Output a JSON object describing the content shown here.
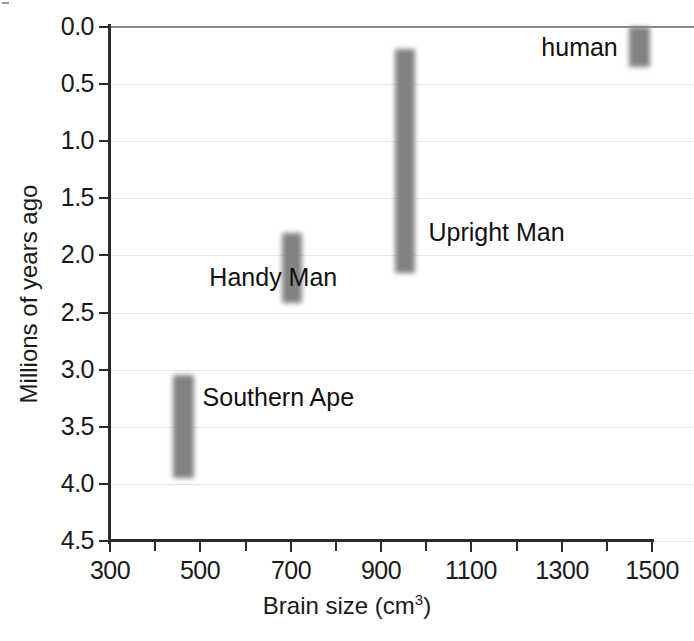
{
  "chart_data": {
    "type": "bar",
    "orientation": "vertical-range",
    "title": "",
    "xlabel": "Brain size (cm",
    "xlabel_sup": "3",
    "xlabel_suffix": ")",
    "xlabel_full": "Brain size (cm3)",
    "ylabel": "Millions of years ago",
    "xlim": [
      300,
      1500
    ],
    "ylim": [
      0.0,
      4.5
    ],
    "y_inverted": true,
    "grid": true,
    "legend": "none",
    "xticks": [
      300,
      500,
      700,
      900,
      1100,
      1300,
      1500
    ],
    "xtick_labels": [
      "300",
      "500",
      "700",
      "900",
      "1100",
      "1300",
      "1500"
    ],
    "x_minor_ticks": [
      400,
      600,
      800,
      1000,
      1200,
      1400
    ],
    "yticks": [
      0.0,
      0.5,
      1.0,
      1.5,
      2.0,
      2.5,
      3.0,
      3.5,
      4.0,
      4.5
    ],
    "ytick_labels": [
      "0.0",
      "0.5",
      "1.0",
      "1.5",
      "2.0",
      "2.5",
      "3.0",
      "3.5",
      "4.0",
      "4.5"
    ],
    "bar_color": "#828282",
    "series": [
      {
        "name": "Southern Ape",
        "label": "Southern Ape",
        "brain_size_min": 440,
        "brain_size_max": 485,
        "age_start": 3.95,
        "age_end": 3.05,
        "label_x": 505,
        "label_y": 3.25
      },
      {
        "name": "Handy Man",
        "label": "Handy Man",
        "brain_size_min": 680,
        "brain_size_max": 725,
        "age_start": 2.42,
        "age_end": 1.8,
        "label_x": 520,
        "label_y": 2.2
      },
      {
        "name": "Upright Man",
        "label": "Upright Man",
        "brain_size_min": 930,
        "brain_size_max": 975,
        "age_start": 2.15,
        "age_end": 0.19,
        "label_x": 1005,
        "label_y": 1.8
      },
      {
        "name": "human",
        "label": "human",
        "brain_size_min": 1450,
        "brain_size_max": 1495,
        "age_start": 0.35,
        "age_end": 0.0,
        "label_x": 1255,
        "label_y": 0.18
      }
    ]
  },
  "axes": {
    "ytick_labels": [
      "0.0",
      "0.5",
      "1.0",
      "1.5",
      "2.0",
      "2.5",
      "3.0",
      "3.5",
      "4.0",
      "4.5"
    ],
    "xtick_labels": [
      "300",
      "500",
      "700",
      "900",
      "1100",
      "1300",
      "1500"
    ],
    "ylabel": "Millions of years ago",
    "xlabel_main": "Brain size (cm",
    "xlabel_sup": "3",
    "xlabel_tail": ")"
  },
  "labels": {
    "southern_ape": "Southern Ape",
    "handy_man": "Handy Man",
    "upright_man": "Upright Man",
    "human": "human"
  }
}
